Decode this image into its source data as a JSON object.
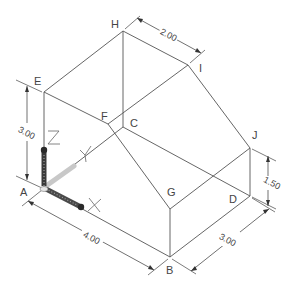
{
  "diagram": {
    "type": "isometric-technical-drawing",
    "vertices": {
      "A": {
        "label": "A",
        "x": 44,
        "y": 188
      },
      "B": {
        "label": "B",
        "x": 170,
        "y": 257
      },
      "C": {
        "label": "C",
        "x": 123,
        "y": 127
      },
      "D": {
        "label": "D",
        "x": 250,
        "y": 196
      },
      "E": {
        "label": "E",
        "x": 44,
        "y": 92
      },
      "F": {
        "label": "F",
        "x": 108,
        "y": 124
      },
      "G": {
        "label": "G",
        "x": 170,
        "y": 209
      },
      "H": {
        "label": "H",
        "x": 123,
        "y": 31
      },
      "I": {
        "label": "I",
        "x": 188,
        "y": 65
      },
      "J": {
        "label": "J",
        "x": 250,
        "y": 148
      }
    },
    "dimensions": {
      "height_AE": "3.00",
      "length_AB": "4.00",
      "depth_BD": "3.00",
      "height_DJ": "1.50",
      "ridge_HI": "2.00"
    },
    "triad": {
      "x_label": "X",
      "y_label": "Y",
      "z_label": "Z"
    },
    "colors": {
      "line": "#555555",
      "triad_dark": "#3a3a3a",
      "triad_light": "#bdbdbd"
    }
  }
}
